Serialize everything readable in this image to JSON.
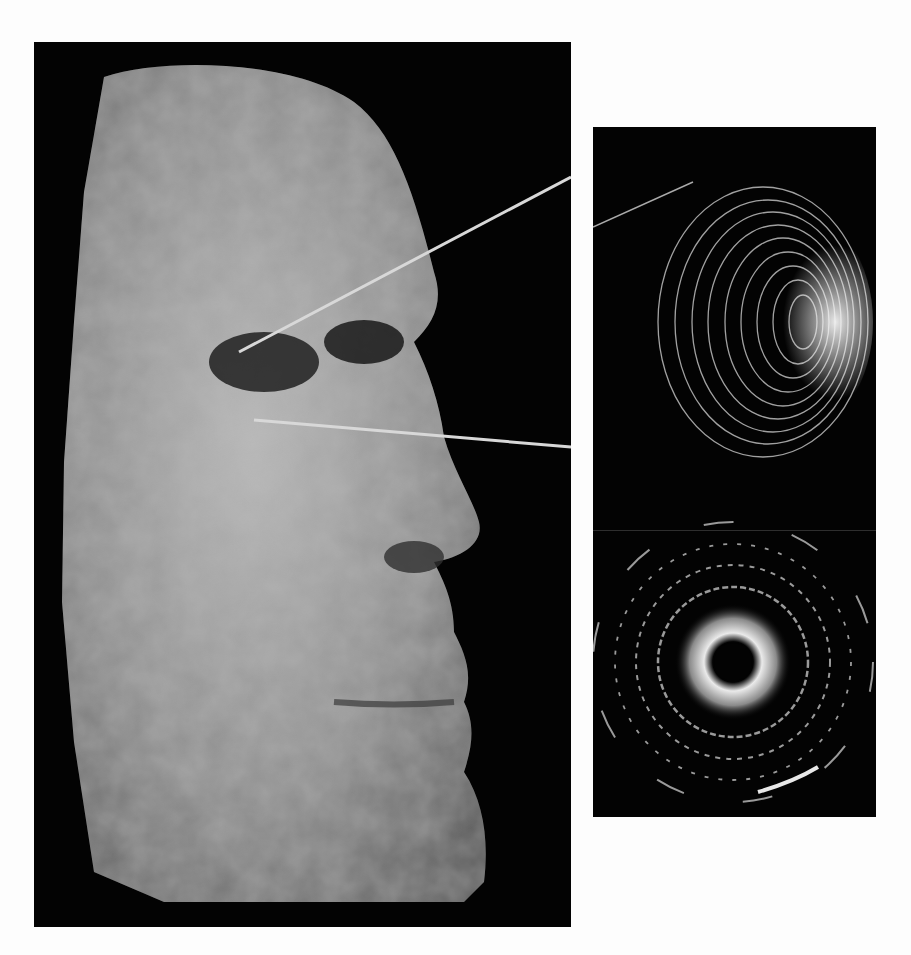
{
  "figure": {
    "main_panel": {
      "subject": "3D surface rendering of human face in profile (right-facing)",
      "colors": {
        "background": "#030303",
        "surface_light": "#c8c8c8",
        "surface_mid": "#8a8a8a",
        "surface_dark": "#4a4a4a"
      }
    },
    "inset_top": {
      "subject": "Concentric-ring mesh dome (eye surface reconstruction)",
      "colors": {
        "background": "#030303",
        "rings": "#bdbdbd",
        "highlight": "#f2f2f2"
      }
    },
    "inset_bottom": {
      "subject": "Concentric diffraction ring pattern",
      "ring_count": 4,
      "colors": {
        "background": "#030303",
        "center_ring": "#e6e6e6",
        "outer_rings": "#9a9a9a"
      }
    },
    "leader_lines": {
      "count": 2,
      "color": "#d8d8d8"
    },
    "page_background": "#fdfdfd"
  }
}
